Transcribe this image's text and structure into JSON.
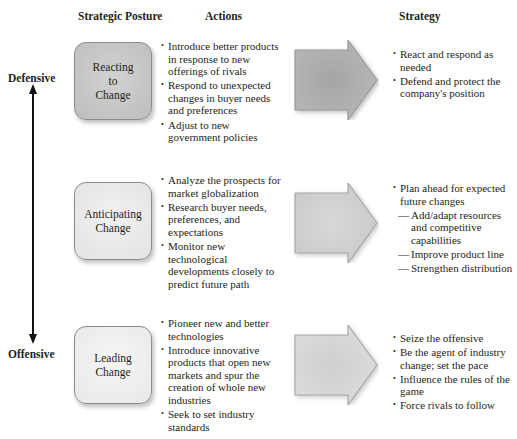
{
  "headers": {
    "posture": "Strategic Posture",
    "actions": "Actions",
    "strategy": "Strategy"
  },
  "axis": {
    "top_label": "Defensive",
    "bottom_label": "Offensive",
    "icon": "double-headed-vertical-arrow"
  },
  "rows": [
    {
      "posture_lines": [
        "Reacting",
        "to",
        "Change"
      ],
      "box_color": "#c9c9c9",
      "arrow_color": "#a9a9a9",
      "actions": [
        "Introduce better products in response to new offerings of rivals",
        "Respond to unexpected changes in buyer needs and preferences",
        "Adjust to new government policies"
      ],
      "strategy": [
        {
          "text": "React and respond as needed",
          "level": 0
        },
        {
          "text": "Defend and protect the company's position",
          "level": 0
        }
      ]
    },
    {
      "posture_lines": [
        "Anticipating",
        "Change"
      ],
      "box_color": "#ececec",
      "arrow_color": "#d6d6d6",
      "actions": [
        "Analyze the prospects for market globalization",
        "Research buyer needs, preferences, and expectations",
        "Monitor new technological developments closely to predict future path"
      ],
      "strategy": [
        {
          "text": "Plan ahead for expected future changes",
          "level": 0
        },
        {
          "text": "Add/adapt resources and competitive capabilities",
          "level": 1
        },
        {
          "text": "Improve product line",
          "level": 1
        },
        {
          "text": "Strengthen distribution",
          "level": 1
        }
      ]
    },
    {
      "posture_lines": [
        "Leading",
        "Change"
      ],
      "box_color": "#f1f1f1",
      "arrow_color": "#dcdcdc",
      "actions": [
        "Pioneer new and better technologies",
        "Introduce innovative products that open new markets and spur the creation of whole new industries",
        "Seek to set industry standards"
      ],
      "strategy": [
        {
          "text": "Seize the offensive",
          "level": 0
        },
        {
          "text": "Be the agent of industry change; set the pace",
          "level": 0
        },
        {
          "text": "Influence the rules of the game",
          "level": 0
        },
        {
          "text": "Force rivals to follow",
          "level": 0
        }
      ]
    }
  ]
}
